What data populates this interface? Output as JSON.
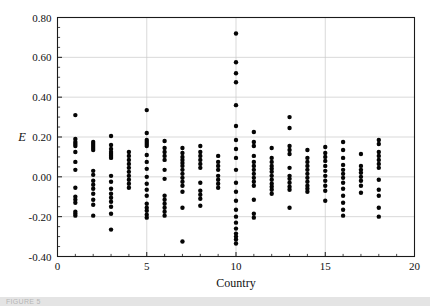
{
  "figure": {
    "background_color": "#ffffff",
    "point_color": "#050505",
    "grid_color": "#c9c9c9",
    "axis_color": "#1a1a1a",
    "footer_caption": "FIGURE 5"
  },
  "chart_data": {
    "type": "scatter",
    "title": "",
    "xlabel": "Country",
    "ylabel": "E",
    "xlim": [
      0,
      20
    ],
    "ylim": [
      -0.4,
      0.8
    ],
    "xticks": [
      0,
      5,
      10,
      15,
      20
    ],
    "xtick_labels": [
      "0",
      "5",
      "10",
      "15",
      "20"
    ],
    "x_minor_tick_step": 1,
    "yticks": [
      -0.4,
      -0.2,
      0.0,
      0.2,
      0.4,
      0.6,
      0.8
    ],
    "ytick_labels": [
      "-0.40",
      "-0.20",
      "0.00",
      "0.20",
      "0.40",
      "0.60",
      "0.80"
    ],
    "grid": "horizontal gridlines at 0.60, 0.40, 0.20, 0.00, -0.20; vertical gridlines at 5, 10, 15",
    "legend": "none",
    "marker": "filled circle",
    "marker_radius_px": 2.2,
    "series": [
      {
        "name": "E by country",
        "points": [
          {
            "x": 1,
            "y": 0.31
          },
          {
            "x": 1,
            "y": 0.19
          },
          {
            "x": 1,
            "y": 0.175
          },
          {
            "x": 1,
            "y": 0.165
          },
          {
            "x": 1,
            "y": 0.155
          },
          {
            "x": 1,
            "y": 0.125
          },
          {
            "x": 1,
            "y": 0.075
          },
          {
            "x": 1,
            "y": 0.035
          },
          {
            "x": 1,
            "y": -0.055
          },
          {
            "x": 1,
            "y": -0.1
          },
          {
            "x": 1,
            "y": -0.115
          },
          {
            "x": 1,
            "y": -0.13
          },
          {
            "x": 1,
            "y": -0.175
          },
          {
            "x": 1,
            "y": -0.185
          },
          {
            "x": 1,
            "y": -0.195
          },
          {
            "x": 2,
            "y": 0.175
          },
          {
            "x": 2,
            "y": 0.165
          },
          {
            "x": 2,
            "y": 0.155
          },
          {
            "x": 2,
            "y": 0.145
          },
          {
            "x": 2,
            "y": 0.135
          },
          {
            "x": 2,
            "y": 0.03
          },
          {
            "x": 2,
            "y": 0.01
          },
          {
            "x": 2,
            "y": -0.02
          },
          {
            "x": 2,
            "y": -0.04
          },
          {
            "x": 2,
            "y": -0.06
          },
          {
            "x": 2,
            "y": -0.085
          },
          {
            "x": 2,
            "y": -0.115
          },
          {
            "x": 2,
            "y": -0.14
          },
          {
            "x": 2,
            "y": -0.195
          },
          {
            "x": 3,
            "y": 0.205
          },
          {
            "x": 3,
            "y": 0.16
          },
          {
            "x": 3,
            "y": 0.14
          },
          {
            "x": 3,
            "y": 0.125
          },
          {
            "x": 3,
            "y": 0.115
          },
          {
            "x": 3,
            "y": 0.105
          },
          {
            "x": 3,
            "y": 0.095
          },
          {
            "x": 3,
            "y": 0.005
          },
          {
            "x": 3,
            "y": -0.025
          },
          {
            "x": 3,
            "y": -0.06
          },
          {
            "x": 3,
            "y": -0.085
          },
          {
            "x": 3,
            "y": -0.105
          },
          {
            "x": 3,
            "y": -0.125
          },
          {
            "x": 3,
            "y": -0.15
          },
          {
            "x": 3,
            "y": -0.185
          },
          {
            "x": 3,
            "y": -0.265
          },
          {
            "x": 4,
            "y": 0.125
          },
          {
            "x": 4,
            "y": 0.105
          },
          {
            "x": 4,
            "y": 0.085
          },
          {
            "x": 4,
            "y": 0.065
          },
          {
            "x": 4,
            "y": 0.045
          },
          {
            "x": 4,
            "y": 0.025
          },
          {
            "x": 4,
            "y": 0.005
          },
          {
            "x": 4,
            "y": -0.015
          },
          {
            "x": 4,
            "y": -0.035
          },
          {
            "x": 4,
            "y": -0.055
          },
          {
            "x": 5,
            "y": 0.335
          },
          {
            "x": 5,
            "y": 0.22
          },
          {
            "x": 5,
            "y": 0.185
          },
          {
            "x": 5,
            "y": 0.175
          },
          {
            "x": 5,
            "y": 0.165
          },
          {
            "x": 5,
            "y": 0.155
          },
          {
            "x": 5,
            "y": 0.11
          },
          {
            "x": 5,
            "y": 0.075
          },
          {
            "x": 5,
            "y": 0.04
          },
          {
            "x": 5,
            "y": 0.0
          },
          {
            "x": 5,
            "y": -0.035
          },
          {
            "x": 5,
            "y": -0.065
          },
          {
            "x": 5,
            "y": -0.095
          },
          {
            "x": 5,
            "y": -0.135
          },
          {
            "x": 5,
            "y": -0.155
          },
          {
            "x": 5,
            "y": -0.17
          },
          {
            "x": 5,
            "y": -0.19
          },
          {
            "x": 5,
            "y": -0.205
          },
          {
            "x": 6,
            "y": 0.18
          },
          {
            "x": 6,
            "y": 0.145
          },
          {
            "x": 6,
            "y": 0.125
          },
          {
            "x": 6,
            "y": 0.105
          },
          {
            "x": 6,
            "y": 0.085
          },
          {
            "x": 6,
            "y": 0.035
          },
          {
            "x": 6,
            "y": -0.01
          },
          {
            "x": 6,
            "y": -0.095
          },
          {
            "x": 6,
            "y": -0.115
          },
          {
            "x": 6,
            "y": -0.135
          },
          {
            "x": 6,
            "y": -0.155
          },
          {
            "x": 6,
            "y": -0.175
          },
          {
            "x": 6,
            "y": -0.195
          },
          {
            "x": 7,
            "y": 0.145
          },
          {
            "x": 7,
            "y": 0.12
          },
          {
            "x": 7,
            "y": 0.1
          },
          {
            "x": 7,
            "y": 0.085
          },
          {
            "x": 7,
            "y": 0.07
          },
          {
            "x": 7,
            "y": 0.055
          },
          {
            "x": 7,
            "y": 0.035
          },
          {
            "x": 7,
            "y": 0.015
          },
          {
            "x": 7,
            "y": -0.005
          },
          {
            "x": 7,
            "y": -0.025
          },
          {
            "x": 7,
            "y": -0.045
          },
          {
            "x": 7,
            "y": -0.075
          },
          {
            "x": 7,
            "y": -0.155
          },
          {
            "x": 7,
            "y": -0.325
          },
          {
            "x": 8,
            "y": 0.155
          },
          {
            "x": 8,
            "y": 0.125
          },
          {
            "x": 8,
            "y": 0.105
          },
          {
            "x": 8,
            "y": 0.085
          },
          {
            "x": 8,
            "y": 0.065
          },
          {
            "x": 8,
            "y": 0.045
          },
          {
            "x": 8,
            "y": -0.03
          },
          {
            "x": 8,
            "y": -0.07
          },
          {
            "x": 8,
            "y": -0.09
          },
          {
            "x": 8,
            "y": -0.11
          },
          {
            "x": 8,
            "y": -0.145
          },
          {
            "x": 9,
            "y": 0.105
          },
          {
            "x": 9,
            "y": 0.075
          },
          {
            "x": 9,
            "y": 0.055
          },
          {
            "x": 9,
            "y": 0.035
          },
          {
            "x": 9,
            "y": 0.005
          },
          {
            "x": 9,
            "y": -0.015
          },
          {
            "x": 9,
            "y": -0.035
          },
          {
            "x": 9,
            "y": -0.055
          },
          {
            "x": 10,
            "y": 0.72
          },
          {
            "x": 10,
            "y": 0.575
          },
          {
            "x": 10,
            "y": 0.52
          },
          {
            "x": 10,
            "y": 0.475
          },
          {
            "x": 10,
            "y": 0.36
          },
          {
            "x": 10,
            "y": 0.255
          },
          {
            "x": 10,
            "y": 0.185
          },
          {
            "x": 10,
            "y": 0.14
          },
          {
            "x": 10,
            "y": 0.095
          },
          {
            "x": 10,
            "y": 0.035
          },
          {
            "x": 10,
            "y": -0.03
          },
          {
            "x": 10,
            "y": -0.075
          },
          {
            "x": 10,
            "y": -0.12
          },
          {
            "x": 10,
            "y": -0.165
          },
          {
            "x": 10,
            "y": -0.2
          },
          {
            "x": 10,
            "y": -0.23
          },
          {
            "x": 10,
            "y": -0.26
          },
          {
            "x": 10,
            "y": -0.285
          },
          {
            "x": 10,
            "y": -0.3
          },
          {
            "x": 10,
            "y": -0.315
          },
          {
            "x": 10,
            "y": -0.335
          },
          {
            "x": 11,
            "y": 0.225
          },
          {
            "x": 11,
            "y": 0.175
          },
          {
            "x": 11,
            "y": 0.155
          },
          {
            "x": 11,
            "y": 0.105
          },
          {
            "x": 11,
            "y": 0.075
          },
          {
            "x": 11,
            "y": 0.055
          },
          {
            "x": 11,
            "y": 0.035
          },
          {
            "x": 11,
            "y": 0.015
          },
          {
            "x": 11,
            "y": -0.005
          },
          {
            "x": 11,
            "y": -0.025
          },
          {
            "x": 11,
            "y": -0.045
          },
          {
            "x": 11,
            "y": -0.115
          },
          {
            "x": 11,
            "y": -0.185
          },
          {
            "x": 11,
            "y": -0.205
          },
          {
            "x": 12,
            "y": 0.145
          },
          {
            "x": 12,
            "y": 0.095
          },
          {
            "x": 12,
            "y": 0.075
          },
          {
            "x": 12,
            "y": 0.055
          },
          {
            "x": 12,
            "y": 0.04
          },
          {
            "x": 12,
            "y": 0.025
          },
          {
            "x": 12,
            "y": 0.005
          },
          {
            "x": 12,
            "y": -0.015
          },
          {
            "x": 12,
            "y": -0.035
          },
          {
            "x": 12,
            "y": -0.05
          },
          {
            "x": 12,
            "y": -0.065
          },
          {
            "x": 12,
            "y": -0.085
          },
          {
            "x": 13,
            "y": 0.3
          },
          {
            "x": 13,
            "y": 0.245
          },
          {
            "x": 13,
            "y": 0.155
          },
          {
            "x": 13,
            "y": 0.135
          },
          {
            "x": 13,
            "y": 0.115
          },
          {
            "x": 13,
            "y": 0.045
          },
          {
            "x": 13,
            "y": 0.005
          },
          {
            "x": 13,
            "y": -0.01
          },
          {
            "x": 13,
            "y": -0.03
          },
          {
            "x": 13,
            "y": -0.05
          },
          {
            "x": 13,
            "y": -0.065
          },
          {
            "x": 13,
            "y": -0.155
          },
          {
            "x": 14,
            "y": 0.135
          },
          {
            "x": 14,
            "y": 0.095
          },
          {
            "x": 14,
            "y": 0.075
          },
          {
            "x": 14,
            "y": 0.055
          },
          {
            "x": 14,
            "y": 0.035
          },
          {
            "x": 14,
            "y": 0.015
          },
          {
            "x": 14,
            "y": -0.005
          },
          {
            "x": 14,
            "y": -0.025
          },
          {
            "x": 14,
            "y": -0.045
          },
          {
            "x": 14,
            "y": -0.06
          },
          {
            "x": 14,
            "y": -0.075
          },
          {
            "x": 15,
            "y": 0.15
          },
          {
            "x": 15,
            "y": 0.12
          },
          {
            "x": 15,
            "y": 0.1
          },
          {
            "x": 15,
            "y": 0.08
          },
          {
            "x": 15,
            "y": 0.055
          },
          {
            "x": 15,
            "y": 0.03
          },
          {
            "x": 15,
            "y": 0.005
          },
          {
            "x": 15,
            "y": -0.02
          },
          {
            "x": 15,
            "y": -0.045
          },
          {
            "x": 15,
            "y": -0.07
          },
          {
            "x": 15,
            "y": -0.12
          },
          {
            "x": 16,
            "y": 0.175
          },
          {
            "x": 16,
            "y": 0.135
          },
          {
            "x": 16,
            "y": 0.095
          },
          {
            "x": 16,
            "y": 0.06
          },
          {
            "x": 16,
            "y": 0.035
          },
          {
            "x": 16,
            "y": 0.015
          },
          {
            "x": 16,
            "y": -0.005
          },
          {
            "x": 16,
            "y": -0.03
          },
          {
            "x": 16,
            "y": -0.06
          },
          {
            "x": 16,
            "y": -0.095
          },
          {
            "x": 16,
            "y": -0.13
          },
          {
            "x": 16,
            "y": -0.165
          },
          {
            "x": 16,
            "y": -0.195
          },
          {
            "x": 17,
            "y": 0.115
          },
          {
            "x": 17,
            "y": 0.055
          },
          {
            "x": 17,
            "y": 0.035
          },
          {
            "x": 17,
            "y": 0.02
          },
          {
            "x": 17,
            "y": 0.0
          },
          {
            "x": 17,
            "y": -0.02
          },
          {
            "x": 17,
            "y": -0.045
          },
          {
            "x": 17,
            "y": -0.08
          },
          {
            "x": 18,
            "y": 0.185
          },
          {
            "x": 18,
            "y": 0.165
          },
          {
            "x": 18,
            "y": 0.125
          },
          {
            "x": 18,
            "y": 0.105
          },
          {
            "x": 18,
            "y": 0.085
          },
          {
            "x": 18,
            "y": 0.065
          },
          {
            "x": 18,
            "y": 0.045
          },
          {
            "x": 18,
            "y": -0.015
          },
          {
            "x": 18,
            "y": -0.065
          },
          {
            "x": 18,
            "y": -0.095
          },
          {
            "x": 18,
            "y": -0.155
          },
          {
            "x": 18,
            "y": -0.2
          }
        ]
      }
    ]
  }
}
